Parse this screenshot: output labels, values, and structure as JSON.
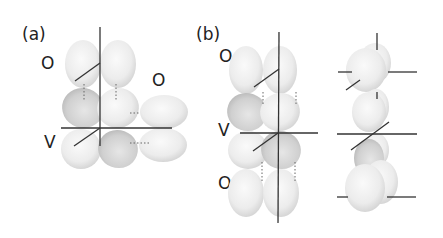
{
  "panels": [
    {
      "id": "a",
      "label": "(a)",
      "site_labels": [
        "O",
        "O",
        "V"
      ]
    },
    {
      "id": "b",
      "label": "(b)",
      "site_labels": [
        "O",
        "V",
        "O"
      ]
    }
  ],
  "colors": {
    "lobe_light": "#f2f2f2",
    "lobe_dark": "#c4c4c4",
    "axis": "#333333",
    "text": "#222222"
  }
}
